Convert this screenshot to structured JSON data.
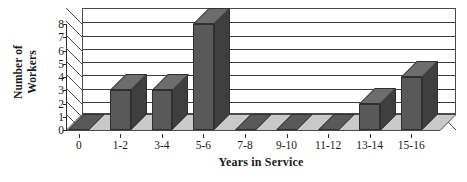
{
  "chart_data": {
    "type": "bar",
    "title": "",
    "xlabel": "Years in Service",
    "ylabel": "Number of Workers",
    "ylabel_line1": "Number of",
    "ylabel_line2": "Workers",
    "categories": [
      "0",
      "1-2",
      "3-4",
      "5-6",
      "7-8",
      "9-10",
      "11-12",
      "13-14",
      "15-16"
    ],
    "values": [
      0,
      3,
      3,
      8,
      0,
      0,
      0,
      2,
      4
    ],
    "ylim": [
      0,
      8
    ],
    "yticks": [
      0,
      1,
      2,
      3,
      4,
      5,
      6,
      7,
      8
    ],
    "ytick_labels": [
      "0",
      "1",
      "2",
      "3",
      "4",
      "5",
      "6",
      "7",
      "8"
    ],
    "grid": true,
    "grid_axis": "y",
    "legend": false,
    "style_3d": true,
    "bar_color": "#595959",
    "bar_side_color": "#3f3f3f",
    "bar_top_color": "#6d6d6d",
    "gridline_color": "#3d3d3d",
    "axis_color": "#2b2b2b",
    "plot_background": "#ffffff"
  }
}
